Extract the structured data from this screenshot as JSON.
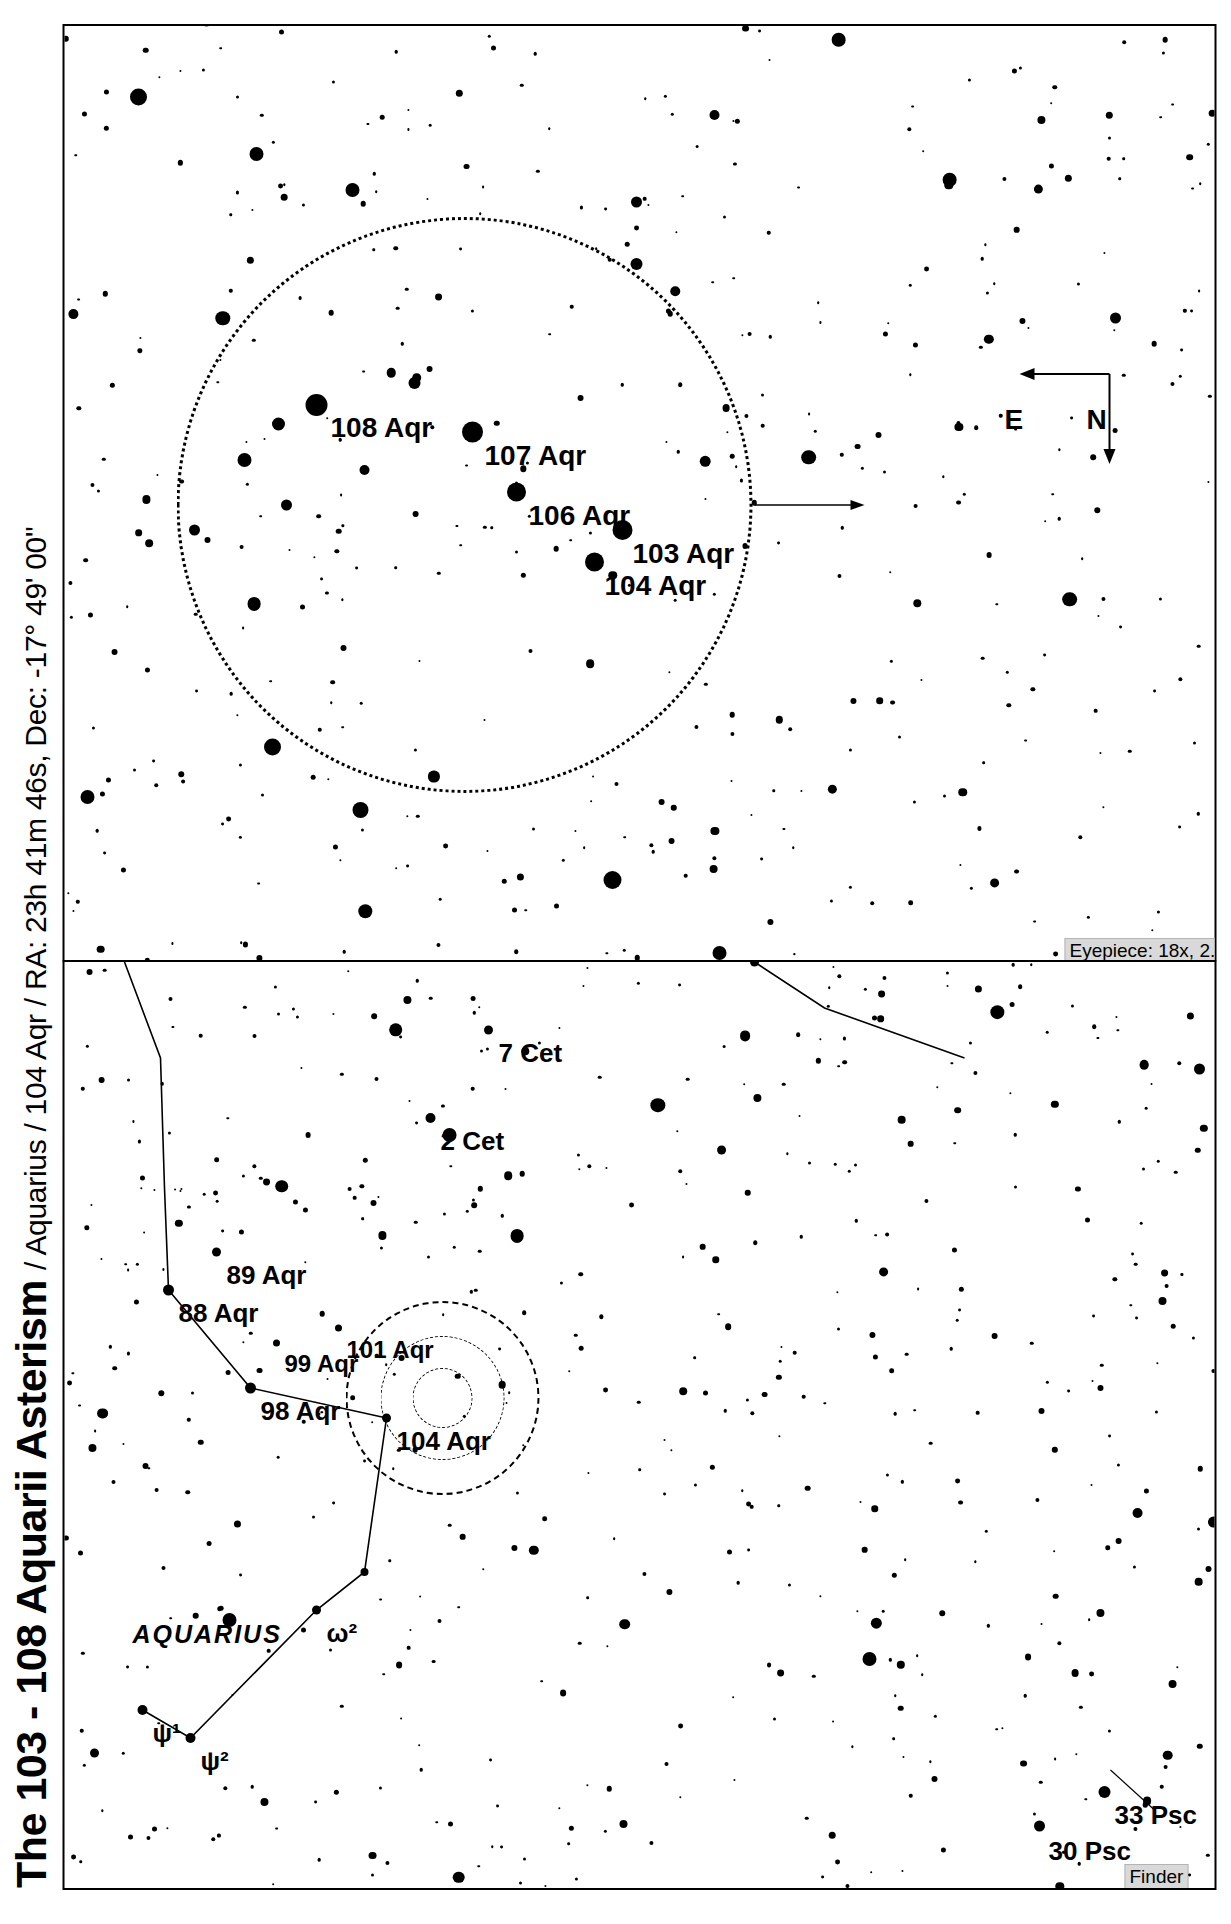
{
  "document": {
    "title_main": "The 103 - 108 Aquarii Asterism",
    "title_sub": "/ Aquarius / 104 Aqr / RA: 23h 41m 46s, Dec: -17° 49' 00\"",
    "object": "104 Aqr",
    "constellation": "Aquarius",
    "ra": "23h 41m 46s",
    "dec": "-17° 49' 00\""
  },
  "panels": {
    "finder": {
      "badge": "Finder",
      "constellation_label": "AQUARIUS",
      "labels": [
        {
          "text": "30 Psc"
        },
        {
          "text": "33 Psc"
        },
        {
          "text": "ψ¹"
        },
        {
          "text": "ψ²"
        },
        {
          "text": "ω²"
        },
        {
          "text": "104 Aqr"
        },
        {
          "text": "98 Aqr"
        },
        {
          "text": "99 Aqr"
        },
        {
          "text": "101 Aqr"
        },
        {
          "text": "88 Aqr"
        },
        {
          "text": "89 Aqr"
        },
        {
          "text": "2 Cet"
        },
        {
          "text": "7 Cet"
        }
      ]
    },
    "eyepiece": {
      "badge": "Eyepiece: 18x, 2.7°",
      "magnification": "18x",
      "field_of_view": "2.7°",
      "compass": {
        "north": "N",
        "east": "E"
      },
      "labels": [
        {
          "text": "103 Aqr"
        },
        {
          "text": "104 Aqr"
        },
        {
          "text": "106 Aqr"
        },
        {
          "text": "107 Aqr"
        },
        {
          "text": "108 Aqr"
        }
      ]
    }
  },
  "chart_data": {
    "type": "scatter",
    "title": "The 103 - 108 Aquarii Asterism",
    "subtitle": "/ Aquarius / 104 Aqr / RA: 23h 41m 46s, Dec: -17° 49' 00\"",
    "grid": false,
    "legend": "none",
    "charts": [
      {
        "name": "finder",
        "label": "Finder",
        "named_stars": [
          {
            "name": "30 Psc",
            "x": 62,
            "y": 975
          },
          {
            "name": "33 Psc",
            "x": 96,
            "y": 1040
          },
          {
            "name": "ψ¹",
            "x": 178,
            "y": 72
          },
          {
            "name": "ψ²",
            "x": 150,
            "y": 120
          },
          {
            "name": "ω²",
            "x": 278,
            "y": 248
          },
          {
            "name": "104 Aqr",
            "x": 470,
            "y": 318
          },
          {
            "name": "98 Aqr",
            "x": 500,
            "y": 180
          },
          {
            "name": "99 Aqr",
            "x": 545,
            "y": 207
          },
          {
            "name": "101 Aqr",
            "x": 560,
            "y": 268
          },
          {
            "name": "88 Aqr",
            "x": 598,
            "y": 100
          },
          {
            "name": "89 Aqr",
            "x": 636,
            "y": 148
          },
          {
            "name": "2 Cet",
            "x": 770,
            "y": 360
          },
          {
            "name": "7 Cet",
            "x": 858,
            "y": 418
          }
        ]
      },
      {
        "name": "eyepiece",
        "label": "Eyepiece: 18x, 2.7°",
        "fov_deg": 2.7,
        "magnification": 18,
        "named_stars": [
          {
            "name": "103 Aqr",
            "x": 430,
            "y": 552
          },
          {
            "name": "104 Aqr",
            "x": 398,
            "y": 527
          },
          {
            "name": "106 Aqr",
            "x": 468,
            "y": 449
          },
          {
            "name": "107 Aqr",
            "x": 528,
            "y": 404
          },
          {
            "name": "108 Aqr",
            "x": 555,
            "y": 248
          }
        ]
      }
    ]
  }
}
